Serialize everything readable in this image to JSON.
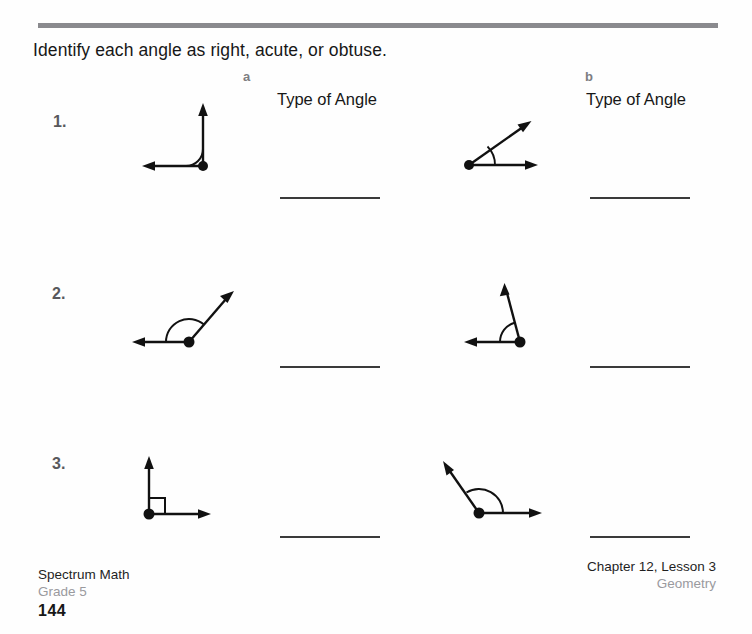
{
  "worksheet": {
    "instruction": "Identify each angle as right, acute, or obtuse.",
    "top_rule_color": "#8a8a8e",
    "columns": [
      {
        "letter": "a",
        "title": "Type of Angle"
      },
      {
        "letter": "b",
        "title": "Type of Angle"
      }
    ],
    "rows": [
      {
        "number": "1.",
        "items": [
          {
            "column": "a",
            "figure": "right-angle-vertex-bottom-right-rays-up-and-left",
            "angle_degrees": 90,
            "answer_value": ""
          },
          {
            "column": "b",
            "figure": "acute-angle-vertex-left-rays-right-and-up-right",
            "angle_degrees": 40,
            "answer_value": ""
          }
        ]
      },
      {
        "number": "2.",
        "items": [
          {
            "column": "a",
            "figure": "obtuse-angle-vertex-bottom-right-rays-left-and-up-right",
            "angle_degrees": 135,
            "answer_value": ""
          },
          {
            "column": "b",
            "figure": "right-angle-vertex-bottom-right-rays-left-and-up",
            "angle_degrees": 95,
            "answer_value": ""
          }
        ]
      },
      {
        "number": "3.",
        "items": [
          {
            "column": "a",
            "figure": "right-angle-vertex-bottom-left-rays-up-and-right-square-marker",
            "angle_degrees": 90,
            "answer_value": ""
          },
          {
            "column": "b",
            "figure": "obtuse-angle-vertex-bottom-left-rays-right-and-up-left",
            "angle_degrees": 140,
            "answer_value": ""
          }
        ]
      }
    ]
  },
  "footer": {
    "left_title": "Spectrum Math",
    "left_sub": "Grade 5",
    "page_number": "144",
    "right_title": "Chapter 12, Lesson 3",
    "right_sub": "Geometry"
  }
}
